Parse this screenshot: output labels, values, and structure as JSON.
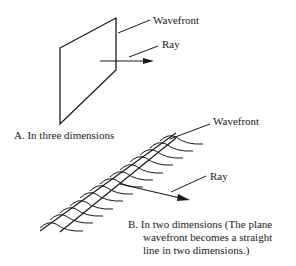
{
  "figure": {
    "part_a": {
      "wavefront_label": "Wavefront",
      "ray_label": "Ray",
      "caption": "A.  In three dimensions"
    },
    "part_b": {
      "wavefront_label": "Wavefront",
      "ray_label": "Ray",
      "caption_line1": "B.  In two dimensions (The plane",
      "caption_line2": "wavefront becomes a straight",
      "caption_line3": "line in two dimensions.)"
    }
  }
}
